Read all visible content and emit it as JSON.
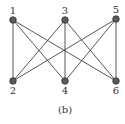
{
  "figure": {
    "caption": "(b)",
    "graph_type": "complete bipartite K3,3",
    "colors": {
      "edge": "#444444",
      "node_fill": "#5a5a5a",
      "node_stroke": "#2a2a2a",
      "label": "#333333"
    },
    "nodes": [
      {
        "id": "1",
        "label": "1",
        "x": 13,
        "y": 20,
        "label_pos": "above"
      },
      {
        "id": "3",
        "label": "3",
        "x": 65,
        "y": 20,
        "label_pos": "above"
      },
      {
        "id": "5",
        "label": "5",
        "x": 116,
        "y": 19,
        "label_pos": "above"
      },
      {
        "id": "2",
        "label": "2",
        "x": 13,
        "y": 81,
        "label_pos": "below"
      },
      {
        "id": "4",
        "label": "4",
        "x": 65,
        "y": 81,
        "label_pos": "below"
      },
      {
        "id": "6",
        "label": "6",
        "x": 116,
        "y": 81,
        "label_pos": "below"
      }
    ],
    "edges": [
      [
        "1",
        "2"
      ],
      [
        "1",
        "4"
      ],
      [
        "1",
        "6"
      ],
      [
        "3",
        "2"
      ],
      [
        "3",
        "4"
      ],
      [
        "3",
        "6"
      ],
      [
        "5",
        "2"
      ],
      [
        "5",
        "4"
      ],
      [
        "5",
        "6"
      ]
    ]
  }
}
